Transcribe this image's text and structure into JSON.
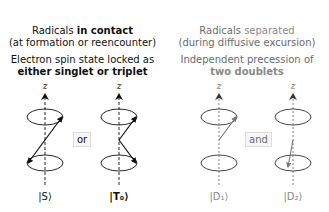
{
  "left_panel": {
    "title_prefix": "Radicals ",
    "title_emphasis": "in contact",
    "subtitle": "(at formation or reencounter)",
    "description_line1": "Electron spin state locked as",
    "description_line2": "either singlet or triplet",
    "conjunction": "or",
    "states": [
      {
        "label": "|S⟩"
      },
      {
        "label": "|T₀⟩"
      }
    ]
  },
  "right_panel": {
    "title_prefix": "Radicals ",
    "title_emphasis": "separated",
    "subtitle": "(during diffusive excursion)",
    "description_line1": "Independent precession of",
    "description_line2": "two doublets",
    "conjunction": "and",
    "states": [
      {
        "label": "|D₁⟩"
      },
      {
        "label": "|D₂⟩"
      }
    ]
  },
  "axis_label": "z",
  "colors": {
    "left_ink": "#111111",
    "right_ink": "#6b6b6b",
    "accent_gray": "#8a8a8a",
    "box_border": "#dcdcdc",
    "box_fill": "#f7f7f7"
  }
}
